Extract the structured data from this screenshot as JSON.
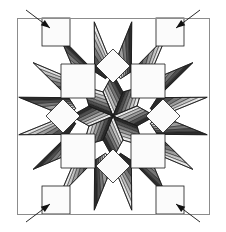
{
  "figure": {
    "name": "broken-star-quilt-block-diagram",
    "background": "#ffffff",
    "canvas": {
      "width": 226,
      "height": 232
    }
  },
  "frame": {
    "name": "quilt-border-frame",
    "stroke": "#8c8c8c",
    "stroke_width": 1,
    "left": 17,
    "top": 18,
    "right": 209,
    "bottom": 214
  },
  "palette": {
    "dark": "#2b2b2b",
    "dark_mid": "#4f4f4f",
    "mid": "#777777",
    "mid_light": "#9e9e9e",
    "light": "#c4c4c4",
    "lightest": "#e4e4e4",
    "white": "#fbfbfb",
    "outline": "#1a1a1a",
    "border": "#8c8c8c",
    "arrow": "#111111"
  },
  "geometry": {
    "center_x": 113,
    "center_y": 116,
    "star_inner_radius": 42,
    "star_outer_radius": 96,
    "strip_count": 6,
    "points": 8
  },
  "strip_shades": [
    "#2b2b2b",
    "#4f4f4f",
    "#777777",
    "#9e9e9e",
    "#c4c4c4",
    "#e8e8e8"
  ],
  "background_shapes": {
    "corner_squares": [
      {
        "name": "corner-square-top-left",
        "x": 42,
        "y": 18,
        "w": 28,
        "h": 28
      },
      {
        "name": "corner-square-top-right",
        "x": 156,
        "y": 18,
        "w": 28,
        "h": 28
      },
      {
        "name": "corner-square-bottom-left",
        "x": 42,
        "y": 186,
        "w": 28,
        "h": 28
      },
      {
        "name": "corner-square-bottom-right",
        "x": 156,
        "y": 186,
        "w": 28,
        "h": 28
      }
    ],
    "inner_squares": [
      {
        "name": "inner-square-top-left",
        "cx": 78,
        "cy": 81
      },
      {
        "name": "inner-square-top-right",
        "cx": 148,
        "cy": 81
      },
      {
        "name": "inner-square-bottom-left",
        "cx": 78,
        "cy": 151
      },
      {
        "name": "inner-square-bottom-right",
        "cx": 148,
        "cy": 151
      }
    ],
    "side_diamonds": [
      {
        "name": "side-diamond-top",
        "cx": 113,
        "cy": 66
      },
      {
        "name": "side-diamond-bottom",
        "cx": 113,
        "cy": 166
      },
      {
        "name": "side-diamond-left",
        "cx": 63,
        "cy": 116
      },
      {
        "name": "side-diamond-right",
        "cx": 163,
        "cy": 116
      }
    ]
  },
  "arrows": [
    {
      "name": "corner-arrow-top-left",
      "tail_x": 26,
      "tail_y": 10,
      "head_x": 50,
      "head_y": 28
    },
    {
      "name": "corner-arrow-top-right",
      "tail_x": 200,
      "tail_y": 10,
      "head_x": 176,
      "head_y": 28
    },
    {
      "name": "corner-arrow-bottom-left",
      "tail_x": 26,
      "tail_y": 222,
      "head_x": 50,
      "head_y": 204
    },
    {
      "name": "corner-arrow-bottom-right",
      "tail_x": 200,
      "tail_y": 222,
      "head_x": 176,
      "head_y": 204
    }
  ]
}
